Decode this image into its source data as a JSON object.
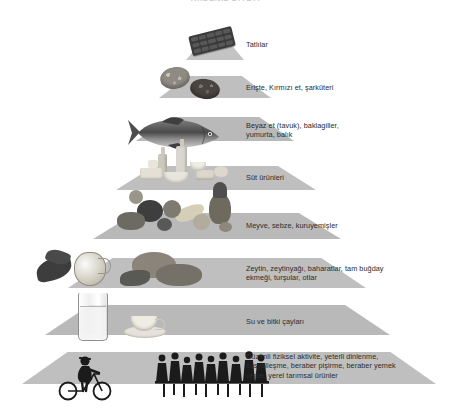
{
  "title": "AKDENİZ DİYETİ",
  "diagram": {
    "type": "food-pyramid",
    "levels": [
      {
        "id": "sweets",
        "label": "Tatlılar",
        "foods": [
          "chocolate-bar"
        ]
      },
      {
        "id": "pasta-red-meat",
        "label": "Erişte, Kırmızı et, şarküteri",
        "foods": [
          "bread-roll",
          "salami-slice"
        ]
      },
      {
        "id": "white-meat",
        "label": "Beyaz et (tavuk), baklagiller,\nyumurta, balık",
        "foods": [
          "fish"
        ]
      },
      {
        "id": "dairy",
        "label": "Süt ürünleri",
        "foods": [
          "milk-bottle",
          "cheese",
          "yogurt-bowl"
        ]
      },
      {
        "id": "fruit-veg",
        "label": "Meyve, sebze, kuruyemişler",
        "foods": [
          "pineapple",
          "banana",
          "grapes",
          "apple",
          "lettuce"
        ]
      },
      {
        "id": "olive-oil",
        "label": "Zeytin, zeytinyağı, baharatlar, tam buğday\nekmeği, turşular, otlar",
        "foods": [
          "olive-branch",
          "olive-oil-jug",
          "whole-wheat-bread"
        ]
      },
      {
        "id": "water",
        "label": "Su ve bitki çayları",
        "foods": [
          "water-glass",
          "tea-cup"
        ]
      },
      {
        "id": "lifestyle",
        "label": "Düzenli fiziksel aktivite, yeterli dinlenme,\nsosyalleşme, beraber pişirme, beraber yemek\nyeme, yerel tarımsal ürünler",
        "foods": [
          "cyclist",
          "people-at-table"
        ]
      }
    ]
  },
  "colors": {
    "band": "#b9b9b9",
    "band_light": "#c4c4c4",
    "text": "#2c2c2c",
    "background": "#ffffff",
    "silhouette": "#1b1b1b"
  }
}
